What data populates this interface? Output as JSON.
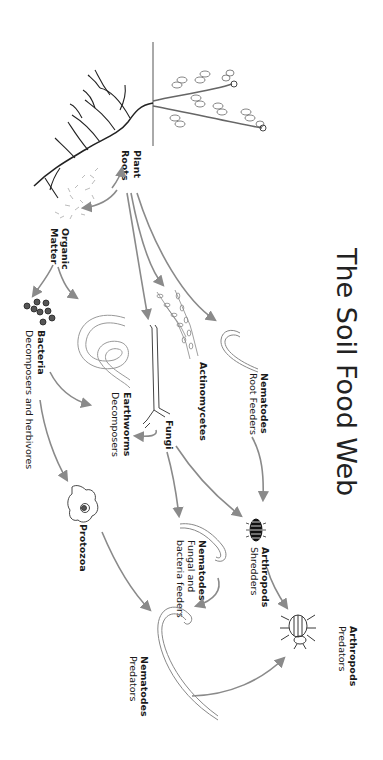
{
  "title": "The Soil Food Web",
  "nodes": {
    "plant_roots": {
      "name_line1": "Plant",
      "name_line2": "Roots"
    },
    "organic_matter": {
      "name_line1": "Organic",
      "name_line2": "Matter"
    },
    "bacteria": {
      "name": "Bacteria",
      "role": "Decomposers and herbivores"
    },
    "earthworms": {
      "name": "Earthworms",
      "role": "Decomposers"
    },
    "fungi": {
      "name": "Fungi"
    },
    "actinomycetes": {
      "name": "Actinomycetes"
    },
    "nematodes_root": {
      "name": "Nematodes",
      "role": "Root Feeders"
    },
    "protozoa": {
      "name": "Protozoa"
    },
    "nematodes_fungal": {
      "name": "Nematodes",
      "role_line1": "Fungal and",
      "role_line2": "bacteria feeders"
    },
    "arthropods_shredders": {
      "name": "Arthropods",
      "role": "Shredders"
    },
    "nematodes_predators": {
      "name": "Nematodes",
      "role": "Predators"
    },
    "arthropods_predators": {
      "name": "Arthropods",
      "role": "Predators"
    }
  },
  "edges": [
    {
      "from": "Organic Matter",
      "to": "Plant Roots"
    },
    {
      "from": "Plant Roots",
      "to": "Organic Matter"
    },
    {
      "from": "Plant Roots",
      "to": "Fungi"
    },
    {
      "from": "Plant Roots",
      "to": "Actinomycetes"
    },
    {
      "from": "Plant Roots",
      "to": "Nematodes Root Feeders"
    },
    {
      "from": "Organic Matter",
      "to": "Bacteria"
    },
    {
      "from": "Organic Matter",
      "to": "Earthworms"
    },
    {
      "from": "Bacteria",
      "to": "Earthworms"
    },
    {
      "from": "Fungi",
      "to": "Earthworms"
    },
    {
      "from": "Bacteria",
      "to": "Protozoa"
    },
    {
      "from": "Fungi",
      "to": "Nematodes Fungal and bacteria feeders"
    },
    {
      "from": "Fungi",
      "to": "Arthropods Shredders"
    },
    {
      "from": "Nematodes Root Feeders",
      "to": "Arthropods Shredders"
    },
    {
      "from": "Protozoa",
      "to": "Nematodes Predators"
    },
    {
      "from": "Nematodes Fungal and bacteria feeders",
      "to": "Nematodes Predators"
    },
    {
      "from": "Arthropods Shredders",
      "to": "Arthropods Predators"
    },
    {
      "from": "Nematodes Predators",
      "to": "Arthropods Predators"
    }
  ],
  "colors": {
    "arrow": "#8a8a8a",
    "text": "#1a1a1a",
    "background": "#ffffff"
  }
}
